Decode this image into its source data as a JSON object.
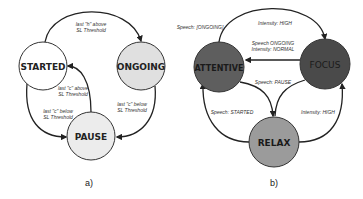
{
  "diagram_a": {
    "caption": "a)",
    "nodes": {
      "started": {
        "label": "STARTED",
        "fill": "#ffffff"
      },
      "ongoing": {
        "label": "ONGOING",
        "fill": "#e0e0e0"
      },
      "pause": {
        "label": "PAUSE",
        "fill": "#ececec"
      }
    },
    "edges": {
      "started_to_ongoing": {
        "line1": "last \"h\" above",
        "line2": "SL Threshold"
      },
      "pause_to_started": {
        "line1": "last \"c\" above",
        "line2": "SL Threshold"
      },
      "started_to_pause": {
        "line1": "last \"c\" below",
        "line2": "SL Threshold"
      },
      "ongoing_to_pause": {
        "line1": "last \"c\" below",
        "line2": "SL Threshold"
      }
    }
  },
  "diagram_b": {
    "caption": "b)",
    "nodes": {
      "attentive": {
        "label": "ATTENTIVE",
        "fill": "#5e5e5e"
      },
      "focus": {
        "label": "FOCUS",
        "fill": "#4a4a4a"
      },
      "relax": {
        "label": "RELAX",
        "fill": "#9b9b9b"
      }
    },
    "edges": {
      "self_attentive": {
        "line1": "Speech: [ONGOING]"
      },
      "attentive_to_focus": {
        "line1": "Intensity: HIGH"
      },
      "focus_to_attentive": {
        "line1": "Speech ONGOING",
        "line2": "Intensity: NORMAL"
      },
      "to_relax": {
        "line1": "Speech: PAUSE"
      },
      "relax_to_attentive": {
        "line1": "Speech: STARTED"
      },
      "relax_to_focus": {
        "line1": "Intensity: HIGH"
      }
    }
  }
}
